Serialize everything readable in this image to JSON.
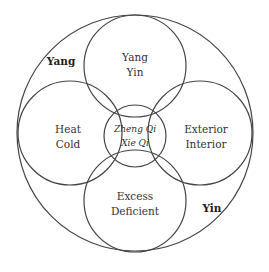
{
  "diagram": {
    "type": "venn-circles",
    "outer": {
      "labels": [
        "Yang",
        "Yin"
      ],
      "color": "#444444"
    },
    "circles": {
      "top": {
        "lines": [
          "Yang",
          "Yin"
        ]
      },
      "left": {
        "lines": [
          "Heat",
          "Cold"
        ]
      },
      "right": {
        "lines": [
          "Exterior",
          "Interior"
        ]
      },
      "bottom": {
        "lines": [
          "Excess",
          "Deficient"
        ]
      },
      "center": {
        "lines": [
          "Zheng Qi",
          "Xie Qi"
        ]
      }
    }
  }
}
